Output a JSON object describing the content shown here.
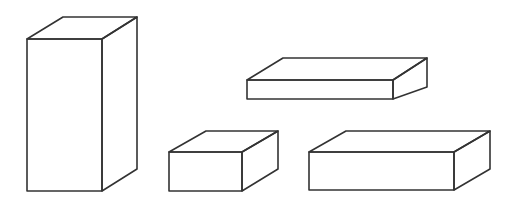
{
  "diagram": {
    "type": "rectangular-prisms",
    "stroke_color": "#333333",
    "fill_color": "#ffffff",
    "stroke_width": 1.6,
    "shapes": [
      {
        "id": "tall-prism",
        "front": [
          [
            27,
            39
          ],
          [
            102,
            39
          ],
          [
            102,
            191
          ],
          [
            27,
            191
          ]
        ],
        "top": [
          [
            27,
            39
          ],
          [
            63,
            17
          ],
          [
            137,
            17
          ],
          [
            102,
            39
          ]
        ],
        "side": [
          [
            102,
            39
          ],
          [
            137,
            17
          ],
          [
            137,
            169
          ],
          [
            102,
            191
          ]
        ]
      },
      {
        "id": "flat-slab",
        "front": [
          [
            247,
            80
          ],
          [
            393,
            80
          ],
          [
            393,
            99
          ],
          [
            247,
            99
          ]
        ],
        "top": [
          [
            247,
            80
          ],
          [
            283,
            58
          ],
          [
            427,
            58
          ],
          [
            393,
            80
          ]
        ],
        "side": [
          [
            393,
            80
          ],
          [
            427,
            58
          ],
          [
            427,
            87
          ],
          [
            393,
            99
          ]
        ]
      },
      {
        "id": "small-box",
        "front": [
          [
            169,
            152
          ],
          [
            242,
            152
          ],
          [
            242,
            191
          ],
          [
            169,
            191
          ]
        ],
        "top": [
          [
            169,
            152
          ],
          [
            206,
            131
          ],
          [
            278,
            131
          ],
          [
            242,
            152
          ]
        ],
        "side": [
          [
            242,
            152
          ],
          [
            278,
            131
          ],
          [
            278,
            169
          ],
          [
            242,
            191
          ]
        ]
      },
      {
        "id": "wide-box",
        "front": [
          [
            309,
            152
          ],
          [
            454,
            152
          ],
          [
            454,
            190
          ],
          [
            309,
            190
          ]
        ],
        "top": [
          [
            309,
            152
          ],
          [
            346,
            131
          ],
          [
            490,
            131
          ],
          [
            454,
            152
          ]
        ],
        "side": [
          [
            454,
            152
          ],
          [
            490,
            131
          ],
          [
            490,
            169
          ],
          [
            454,
            190
          ]
        ]
      }
    ]
  }
}
